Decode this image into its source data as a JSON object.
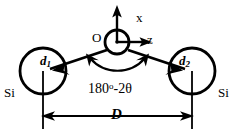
{
  "figure": {
    "background_color": "#ffffff",
    "stroke_color": "#000000",
    "width": 242,
    "height": 133
  },
  "axes": {
    "x_label": "x",
    "z_label": "z",
    "origin_label": "O"
  },
  "atoms": [
    {
      "element_label": "Si",
      "bond_label": "d",
      "bond_index": "1",
      "side": "left"
    },
    {
      "element_label": "Si",
      "bond_label": "d",
      "bond_index": "2",
      "side": "right"
    }
  ],
  "annotations": {
    "angle_value": "180",
    "angle_degree_symbol": "o",
    "angle_remainder": "-2θ",
    "angle_label_full": "180o-2θ",
    "distance_label": "D"
  }
}
